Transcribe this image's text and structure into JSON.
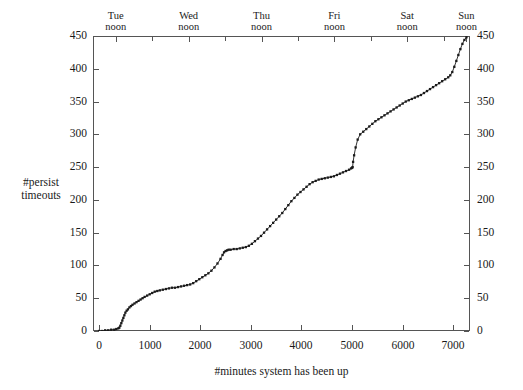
{
  "chart_data": {
    "type": "line",
    "title": "",
    "xlabel": "#minutes system has been up",
    "ylabel": "#persist timeouts",
    "ylabel_lines": [
      "#persist",
      "timeouts"
    ],
    "xlim": [
      -120,
      7330
    ],
    "ylim": [
      0,
      450
    ],
    "grid": false,
    "legend": null,
    "marker": "filled-square",
    "marker_color": "#1a1a1a",
    "line_color": "#1a1a1a",
    "x_ticks": [
      0,
      1000,
      2000,
      3000,
      4000,
      5000,
      6000,
      7000
    ],
    "x_tick_labels": [
      "0",
      "1000",
      "2000",
      "3000",
      "4000",
      "5000",
      "6000",
      "7000"
    ],
    "y_ticks": [
      0,
      50,
      100,
      150,
      200,
      250,
      300,
      350,
      400,
      450
    ],
    "y_tick_labels": [
      "0",
      "50",
      "100",
      "150",
      "200",
      "250",
      "300",
      "350",
      "400",
      "450"
    ],
    "y_ticks_right": [
      0,
      50,
      100,
      150,
      200,
      250,
      300,
      350,
      400,
      450
    ],
    "y_tick_labels_right": [
      "0",
      "50",
      "100",
      "150",
      "200",
      "250",
      "300",
      "350",
      "400",
      "450"
    ],
    "top_axis": {
      "major_ticks_x": [
        330,
        1770,
        3210,
        4650,
        6090,
        7260
      ],
      "minor_ticks_x": [
        1050,
        2490,
        3930,
        5370,
        6810
      ],
      "labels": [
        {
          "x": 330,
          "line1": "Tue",
          "line2": "noon"
        },
        {
          "x": 1770,
          "line1": "Wed",
          "line2": "noon"
        },
        {
          "x": 3210,
          "line1": "Thu",
          "line2": "noon"
        },
        {
          "x": 4650,
          "line1": "Fri",
          "line2": "noon"
        },
        {
          "x": 6090,
          "line1": "Sat",
          "line2": "noon"
        },
        {
          "x": 7260,
          "line1": "Sun",
          "line2": "noon"
        }
      ]
    },
    "x": [
      0,
      60,
      120,
      180,
      240,
      300,
      340,
      380,
      400,
      420,
      440,
      460,
      480,
      500,
      520,
      545,
      570,
      600,
      630,
      660,
      700,
      740,
      780,
      820,
      860,
      900,
      950,
      1000,
      1050,
      1100,
      1150,
      1200,
      1260,
      1320,
      1380,
      1440,
      1500,
      1560,
      1620,
      1680,
      1740,
      1800,
      1860,
      1920,
      1980,
      2040,
      2100,
      2160,
      2220,
      2280,
      2340,
      2400,
      2440,
      2470,
      2500,
      2530,
      2560,
      2600,
      2660,
      2720,
      2780,
      2840,
      2900,
      2960,
      3020,
      3080,
      3140,
      3200,
      3260,
      3320,
      3380,
      3440,
      3500,
      3560,
      3620,
      3680,
      3740,
      3800,
      3860,
      3920,
      3980,
      4040,
      4100,
      4160,
      4220,
      4280,
      4340,
      4400,
      4460,
      4520,
      4580,
      4640,
      4700,
      4760,
      4820,
      4880,
      4940,
      4980,
      5000,
      5010,
      5020,
      5040,
      5070,
      5110,
      5160,
      5220,
      5280,
      5340,
      5400,
      5460,
      5520,
      5580,
      5640,
      5700,
      5760,
      5820,
      5880,
      5940,
      6000,
      6060,
      6120,
      6180,
      6240,
      6300,
      6360,
      6420,
      6480,
      6540,
      6600,
      6660,
      6720,
      6780,
      6840,
      6900,
      6940,
      6980,
      7020,
      7060,
      7100,
      7140,
      7180,
      7220,
      7260
    ],
    "y": [
      0,
      0,
      1,
      1,
      2,
      2,
      3,
      4,
      5,
      8,
      12,
      16,
      20,
      24,
      28,
      31,
      33,
      36,
      38,
      40,
      42,
      44,
      46,
      48,
      50,
      52,
      54,
      56,
      58,
      60,
      61,
      62,
      63,
      64,
      65,
      66,
      66,
      67,
      68,
      69,
      70,
      71,
      73,
      76,
      79,
      82,
      85,
      88,
      92,
      97,
      103,
      110,
      116,
      120,
      122,
      123,
      124,
      124,
      125,
      125,
      126,
      127,
      128,
      130,
      133,
      137,
      141,
      145,
      150,
      155,
      160,
      165,
      170,
      175,
      180,
      186,
      192,
      198,
      203,
      208,
      212,
      216,
      220,
      224,
      227,
      229,
      231,
      232,
      233,
      234,
      235,
      236,
      238,
      240,
      242,
      244,
      246,
      248,
      249,
      250,
      258,
      268,
      280,
      292,
      300,
      304,
      308,
      312,
      316,
      320,
      323,
      326,
      329,
      332,
      335,
      338,
      341,
      344,
      347,
      350,
      352,
      354,
      356,
      358,
      360,
      363,
      366,
      369,
      372,
      375,
      378,
      381,
      384,
      387,
      390,
      395,
      403,
      412,
      421,
      430,
      438,
      444,
      448,
      450
    ]
  }
}
